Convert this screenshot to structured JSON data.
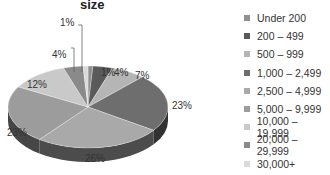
{
  "chart_data": {
    "type": "pie",
    "title": "size",
    "style": "3d-grayscale",
    "categories": [
      "Under 200",
      "200 – 499",
      "500 – 999",
      "1,000 – 2,499",
      "2,500 – 4,999",
      "5,000 – 9,999",
      "10,000 – 19,999",
      "20,000 – 29,999",
      "30,000+"
    ],
    "values": [
      1,
      4,
      7,
      23,
      26,
      23,
      12,
      4,
      1
    ],
    "value_labels": [
      "1%",
      "4%",
      "7%",
      "23%",
      "26%",
      "23%",
      "12%",
      "4%",
      "1%"
    ],
    "legend_position": "right"
  },
  "colors": [
    "#8f8f8f",
    "#5a5a5a",
    "#b5b5b5",
    "#6e6e6e",
    "#a9a9a9",
    "#9c9c9c",
    "#c9c9c9",
    "#8a8a8a",
    "#dadada"
  ],
  "legend": {
    "items": [
      {
        "label": "Under 200",
        "color": "#8f8f8f"
      },
      {
        "label": "200 – 499",
        "color": "#5a5a5a"
      },
      {
        "label": "500 – 999",
        "color": "#b5b5b5"
      },
      {
        "label": "1,000 – 2,499",
        "color": "#6e6e6e"
      },
      {
        "label": "2,500 – 4,999",
        "color": "#a9a9a9"
      },
      {
        "label": "5,000 – 9,999",
        "color": "#9c9c9c"
      },
      {
        "label": "10,000 – 19,999",
        "color": "#c9c9c9"
      },
      {
        "label": "20,000 – 29,999",
        "color": "#8a8a8a"
      },
      {
        "label": "30,000+",
        "color": "#dadada"
      }
    ]
  }
}
